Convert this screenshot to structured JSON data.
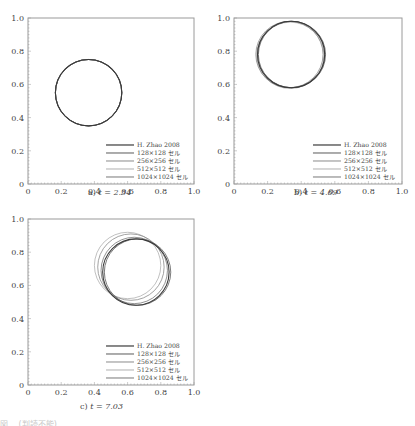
{
  "figure": {
    "panels": [
      {
        "id": "a",
        "label": "a)",
        "time_label": "t = 2.34"
      },
      {
        "id": "b",
        "label": "b)",
        "time_label": "t = 4.69"
      },
      {
        "id": "c",
        "label": "c)",
        "time_label": "t = 7.03"
      }
    ],
    "legend": [
      "H. Zhao 2008",
      "128×128 セル",
      "256×256 セル",
      "512×512 セル",
      "1024×1024 セル"
    ],
    "series_colors": [
      "#3a3a3a",
      "#5a5a5a",
      "#8a8a8a",
      "#b0b0b0",
      "#777777"
    ],
    "x_ticks": [
      "0",
      "0.2",
      "0.4",
      "0.6",
      "0.8",
      "1.0"
    ],
    "y_ticks": [
      "0",
      "0.2",
      "0.4",
      "0.6",
      "0.8",
      "1.0"
    ],
    "bottom_caption": "図 …(判読不能)…"
  },
  "chart_data": [
    {
      "type": "line",
      "title": "a) t = 2.34",
      "xlabel": "",
      "ylabel": "",
      "xlim": [
        0,
        1
      ],
      "ylim": [
        0,
        1
      ],
      "grid": false,
      "legend_position": "lower right",
      "series": [
        {
          "name": "H. Zhao 2008",
          "shape": "circle",
          "center": [
            0.365,
            0.55
          ],
          "radius": 0.2
        },
        {
          "name": "128×128 セル",
          "shape": "circle",
          "center": [
            0.365,
            0.55
          ],
          "radius": 0.2
        },
        {
          "name": "256×256 セル",
          "shape": "circle",
          "center": [
            0.365,
            0.55
          ],
          "radius": 0.2
        },
        {
          "name": "512×512 セル",
          "shape": "circle",
          "center": [
            0.365,
            0.55
          ],
          "radius": 0.2
        },
        {
          "name": "1024×1024 セル",
          "shape": "circle",
          "center": [
            0.365,
            0.55
          ],
          "radius": 0.2
        }
      ]
    },
    {
      "type": "line",
      "title": "b) t = 4.69",
      "xlabel": "",
      "ylabel": "",
      "xlim": [
        0,
        1
      ],
      "ylim": [
        0,
        1
      ],
      "grid": false,
      "legend_position": "lower right",
      "series": [
        {
          "name": "H. Zhao 2008",
          "shape": "circle",
          "center": [
            0.34,
            0.78
          ],
          "radius": 0.2
        },
        {
          "name": "128×128 セル",
          "shape": "circle",
          "center": [
            0.345,
            0.78
          ],
          "radius": 0.2
        },
        {
          "name": "256×256 セル",
          "shape": "circle",
          "center": [
            0.33,
            0.78
          ],
          "radius": 0.2
        },
        {
          "name": "512×512 セル",
          "shape": "circle",
          "center": [
            0.335,
            0.775
          ],
          "radius": 0.2
        },
        {
          "name": "1024×1024 セル",
          "shape": "circle",
          "center": [
            0.34,
            0.78
          ],
          "radius": 0.2
        }
      ]
    },
    {
      "type": "line",
      "title": "c) t = 7.03",
      "xlabel": "",
      "ylabel": "",
      "xlim": [
        0,
        1
      ],
      "ylim": [
        0,
        1
      ],
      "grid": false,
      "legend_position": "lower right",
      "series": [
        {
          "name": "H. Zhao 2008",
          "shape": "circle",
          "center": [
            0.65,
            0.68
          ],
          "radius": 0.2
        },
        {
          "name": "128×128 セル",
          "shape": "circle",
          "center": [
            0.66,
            0.68
          ],
          "radius": 0.2
        },
        {
          "name": "256×256 セル",
          "shape": "circle",
          "center": [
            0.62,
            0.71
          ],
          "radius": 0.2
        },
        {
          "name": "512×512 セル",
          "shape": "circle",
          "center": [
            0.6,
            0.72
          ],
          "radius": 0.2
        },
        {
          "name": "1024×1024 セル",
          "shape": "circle",
          "center": [
            0.64,
            0.69
          ],
          "radius": 0.2
        }
      ]
    }
  ]
}
